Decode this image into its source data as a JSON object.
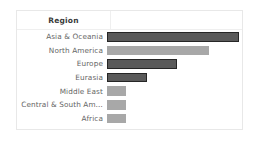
{
  "card": {
    "header": {
      "label_column_title": "Region"
    }
  },
  "chart_data": {
    "type": "bar",
    "orientation": "horizontal",
    "title": "Region",
    "xlabel": "",
    "ylabel": "Region",
    "grid": false,
    "legend": false,
    "axis_visible": false,
    "value_labels_visible": false,
    "categories": [
      "Asia & Oceania",
      "North America",
      "Europe",
      "Eurasia",
      "Middle East",
      "Central & South Am…",
      "Africa"
    ],
    "values": [
      100,
      77,
      53,
      30,
      14,
      14,
      14
    ],
    "xlim": [
      0,
      100
    ],
    "bars": [
      {
        "label": "Asia & Oceania",
        "value": 100,
        "pixel_width": 132,
        "state": "selected",
        "fill": "#5a5a5a",
        "outline": "#262626"
      },
      {
        "label": "North America",
        "value": 77,
        "pixel_width": 102,
        "state": "normal",
        "fill": "#a8a8a8",
        "outline": "none"
      },
      {
        "label": "Europe",
        "value": 53,
        "pixel_width": 70,
        "state": "selected",
        "fill": "#5a5a5a",
        "outline": "#262626"
      },
      {
        "label": "Eurasia",
        "value": 30,
        "pixel_width": 40,
        "state": "selected",
        "fill": "#5a5a5a",
        "outline": "#262626"
      },
      {
        "label": "Middle East",
        "value": 14,
        "pixel_width": 19,
        "state": "normal",
        "fill": "#a8a8a8",
        "outline": "none"
      },
      {
        "label": "Central & South Am…",
        "value": 14,
        "pixel_width": 19,
        "state": "normal",
        "fill": "#a8a8a8",
        "outline": "none"
      },
      {
        "label": "Africa",
        "value": 14,
        "pixel_width": 19,
        "state": "normal",
        "fill": "#a8a8a8",
        "outline": "none"
      }
    ]
  },
  "colors": {
    "bar_selected_fill": "#5a5a5a",
    "bar_selected_outline": "#262626",
    "bar_normal_fill": "#a8a8a8",
    "card_border": "#e8e8e8",
    "divider": "#efefef",
    "header_text": "#3a3a3a",
    "label_text": "#666666",
    "background": "#ffffff"
  }
}
